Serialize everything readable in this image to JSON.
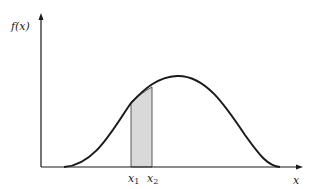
{
  "diagram": {
    "type": "probability-density-curve",
    "y_axis_label": "f(x)",
    "x_axis_label": "x",
    "markers": [
      {
        "label": "x",
        "subscript": "1"
      },
      {
        "label": "x",
        "subscript": "2"
      }
    ],
    "shaded_region": {
      "from": "x1",
      "to": "x2"
    },
    "colors": {
      "stroke": "#1a1a1a",
      "shade": "#d9d9d9",
      "background": "#ffffff"
    }
  }
}
